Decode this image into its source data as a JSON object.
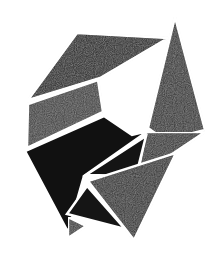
{
  "artwork": {
    "description": "Abstract geometric composition of black and dark-gray polygons separated by thin white lines",
    "background": "#ffffff",
    "colors": {
      "black": "#141414",
      "dark_gray": "#2e2e2e",
      "mid_gray": "#3a3a3a",
      "texture_gray": "#454545",
      "separator": "#ffffff"
    },
    "shapes": [
      {
        "name": "top-wedge",
        "fill": "#1a1a1a",
        "points": "77,33 168,38 100,78 28,100"
      },
      {
        "name": "tall-triangle",
        "fill": "#2f2f2f",
        "points": "175,17 205,130 165,140 148,128"
      },
      {
        "name": "gray-band",
        "fill": "#3d3d3d",
        "points": "28,104 98,80 103,112 27,148"
      },
      {
        "name": "lower-left-black",
        "fill": "#111111",
        "points": "25,151 104,116 132,135 148,131 84,176 68,232"
      },
      {
        "name": "middle-black-triangle",
        "fill": "#141414",
        "points": "86,175 146,136 136,176"
      },
      {
        "name": "right-gray-piece",
        "fill": "#303030",
        "points": "146,132 205,132 175,152 137,178"
      },
      {
        "name": "lower-gray-piece",
        "fill": "#2b2b2b",
        "points": "88,181 176,153 134,240"
      },
      {
        "name": "bottom-black-triangle",
        "fill": "#151515",
        "points": "87,186 125,229 67,214"
      },
      {
        "name": "bottom-small-triangle",
        "fill": "#3a3a3a",
        "points": "68,217 86,226 68,238"
      }
    ]
  }
}
